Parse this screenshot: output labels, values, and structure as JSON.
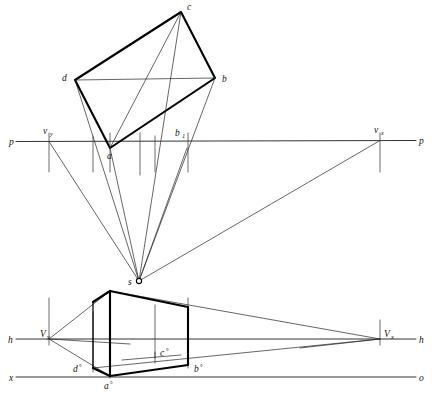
{
  "colors": {
    "ink": "#111111",
    "line": "#1a1a1a",
    "reference": "#3a3a3a",
    "background": "#ffffff"
  },
  "axes": {
    "picture_plane_left": "p",
    "picture_plane_right": "p",
    "horizon_left": "h",
    "horizon_right": "h",
    "ground_left": "x",
    "ground_right": "o"
  },
  "plan_view": {
    "vertices": [
      {
        "id": "a",
        "label": "a",
        "x": 110,
        "y": 148
      },
      {
        "id": "b",
        "label": "b",
        "x": 215,
        "y": 78
      },
      {
        "id": "c",
        "label": "c",
        "x": 181,
        "y": 12
      },
      {
        "id": "d",
        "label": "d",
        "x": 75,
        "y": 80
      }
    ],
    "auxiliary_point": {
      "id": "b1",
      "label": "b",
      "subscript": "1",
      "x": 187,
      "y": 148
    }
  },
  "station_point": {
    "id": "s",
    "label": "s",
    "x": 139,
    "y": 281
  },
  "vanishing_points": {
    "upper": [
      {
        "id": "vy_top",
        "label": "v",
        "subscript": "y",
        "x": 49,
        "y": 141
      },
      {
        "id": "vx_top",
        "label": "v",
        "subscript": "x",
        "x": 380,
        "y": 141
      }
    ],
    "lower": [
      {
        "id": "Vy",
        "label": "V",
        "subscript": "y",
        "x": 49,
        "y": 339
      },
      {
        "id": "Vx",
        "label": "V",
        "subscript": "x",
        "x": 380,
        "y": 339
      }
    ]
  },
  "perspective_view": {
    "vertices": [
      {
        "id": "a0",
        "label": "a",
        "mark": "°",
        "x": 110,
        "y": 375
      },
      {
        "id": "b0",
        "label": "b",
        "mark": "°",
        "x": 188,
        "y": 365
      },
      {
        "id": "c0",
        "label": "c",
        "mark": "°",
        "x": 155,
        "y": 352
      },
      {
        "id": "d0",
        "label": "d",
        "mark": "°",
        "x": 86,
        "y": 362
      }
    ]
  },
  "line_labels": {
    "p_left": "p",
    "p_right": "p",
    "h_left": "h",
    "h_right": "h",
    "x_left": "x",
    "o_right": "o"
  }
}
